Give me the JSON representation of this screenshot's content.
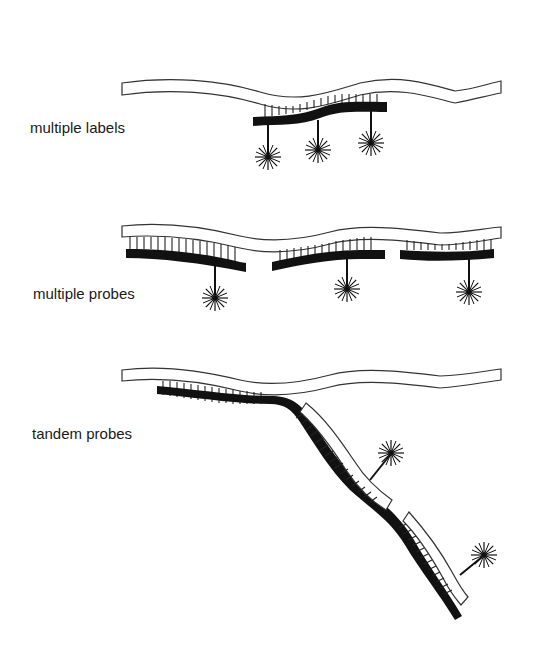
{
  "diagram": {
    "panels": [
      {
        "id": "multiple-labels",
        "label": "multiple labels",
        "description": "One probe strand hybridized to target, carrying three fluorescent labels"
      },
      {
        "id": "multiple-probes",
        "label": "multiple probes",
        "description": "Three separate probes hybridized along the target, each with one label"
      },
      {
        "id": "tandem-probes",
        "label": "tandem probes",
        "description": "First probe hybridizes to target; its tail is bound by two labelled secondary probes"
      }
    ],
    "colors": {
      "target_strand_fill": "#ffffff",
      "outline": "#222222",
      "probe_strand": "#111111",
      "background": "#ffffff"
    }
  }
}
